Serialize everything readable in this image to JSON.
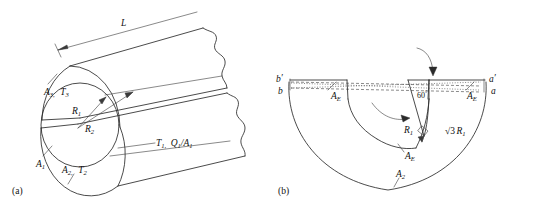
{
  "figure": {
    "caption_a": "(a)",
    "caption_b": "(b)",
    "panel_a": {
      "length_label": "L",
      "radius_inner": "R",
      "radius_inner_sub": "1",
      "radius_outer": "R",
      "radius_outer_sub": "2",
      "area3": "A",
      "area3_sub": "3,",
      "temp3": "T",
      "temp3_sub": "3",
      "area1": "A",
      "area1_sub": "1",
      "area2": "A",
      "area2_sub": "2,",
      "temp2": "T",
      "temp2_sub": "2",
      "flux_t1": "T",
      "flux_t1_sub": "1,",
      "flux_q1": "Q",
      "flux_q1_sub": "1",
      "flux_slash": "/",
      "flux_a1": "A",
      "flux_a1_sub": "1"
    },
    "panel_b": {
      "point_b_prime": "b",
      "point_b_prime_mark": "′",
      "point_b": "b",
      "point_a_prime": "a",
      "point_a_prime_mark": "′",
      "point_a": "a",
      "angle": "60",
      "angle_unit": "°",
      "ae_left": "A",
      "ae_left_sub": "E",
      "ae_right": "A",
      "ae_right_sub": "E",
      "ae_bottom": "A",
      "ae_bottom_sub": "E",
      "a2": "A",
      "a2_sub": "2",
      "r1": "R",
      "r1_sub": "1",
      "sqrt3": "√3",
      "sqrt3_r": "R",
      "sqrt3_r_sub": "1"
    }
  },
  "colors": {
    "line": "#2b2b2b",
    "thin": "#3a3a3a",
    "background": "#ffffff"
  }
}
